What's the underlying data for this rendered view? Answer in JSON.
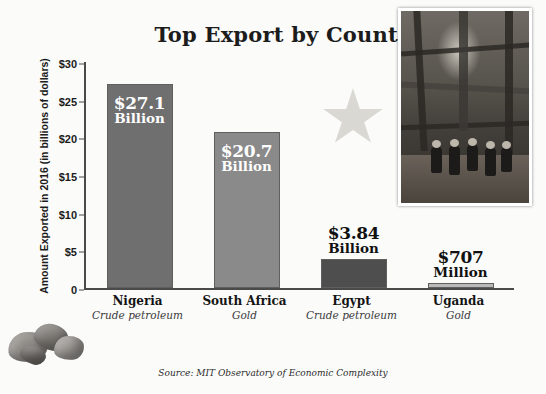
{
  "title": "Top Export by Country",
  "y_axis_title": "Amount Exported in 2016 (in billions of dollars)",
  "source": "Source: MIT Observatory of Economic Complexity",
  "y_ticks": [
    "$30",
    "$25",
    "$20",
    "$15",
    "$10",
    "$5",
    "0"
  ],
  "colors": {
    "bar_dark": "#6f6f6f",
    "bar_mid": "#8a8a8a",
    "bar_light": "#a3a3a3",
    "bar_pale": "#b9b9b9",
    "axis": "#4a4a4a",
    "title_text": "#1c1c1c"
  },
  "chart_data": {
    "type": "bar",
    "title": "Top Export by Country",
    "xlabel": "",
    "ylabel": "Amount Exported in 2016 (in billions of dollars)",
    "ylim": [
      0,
      30
    ],
    "yticks": [
      0,
      5,
      10,
      15,
      20,
      25,
      30
    ],
    "ytick_labels": [
      "0",
      "$5",
      "$10",
      "$15",
      "$20",
      "$25",
      "$30"
    ],
    "grid": false,
    "legend": "none",
    "categories": [
      "Nigeria",
      "South Africa",
      "Egypt",
      "Uganda"
    ],
    "values": [
      27.1,
      20.7,
      3.84,
      0.707
    ],
    "bars": [
      {
        "country": "Nigeria",
        "product": "Crude petroleum",
        "value": 27.1,
        "amount_label": "$27.1",
        "unit_label": "Billion",
        "label_position": "inside",
        "color": "#6f6f6f"
      },
      {
        "country": "South Africa",
        "product": "Gold",
        "value": 20.7,
        "amount_label": "$20.7",
        "unit_label": "Billion",
        "label_position": "inside",
        "color": "#8a8a8a"
      },
      {
        "country": "Egypt",
        "product": "Crude petroleum",
        "value": 3.84,
        "amount_label": "$3.84",
        "unit_label": "Billion",
        "label_position": "above",
        "color": "#4e4e4e"
      },
      {
        "country": "Uganda",
        "product": "Gold",
        "value": 0.707,
        "amount_label": "$707",
        "unit_label": "Million",
        "label_position": "above",
        "color": "#b9b9b9"
      }
    ]
  },
  "photo": {
    "caption": "oil-rig-workers-photo"
  }
}
